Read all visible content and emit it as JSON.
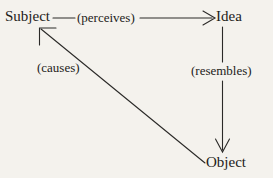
{
  "diagram": {
    "background_color": "#f4f2ed",
    "stroke_color": "#2b2a28",
    "nodes": [
      {
        "id": "subject",
        "label": "Subject"
      },
      {
        "id": "idea",
        "label": "Idea"
      },
      {
        "id": "object",
        "label": "Object"
      }
    ],
    "edges": [
      {
        "id": "perceives",
        "label": "(perceives)",
        "from": "subject",
        "to": "idea",
        "direction": "right"
      },
      {
        "id": "resembles",
        "label": "(resembles)",
        "from": "idea",
        "to": "object",
        "direction": "down"
      },
      {
        "id": "causes",
        "label": "(causes)",
        "from": "object",
        "to": "subject",
        "direction": "up-left"
      }
    ]
  }
}
